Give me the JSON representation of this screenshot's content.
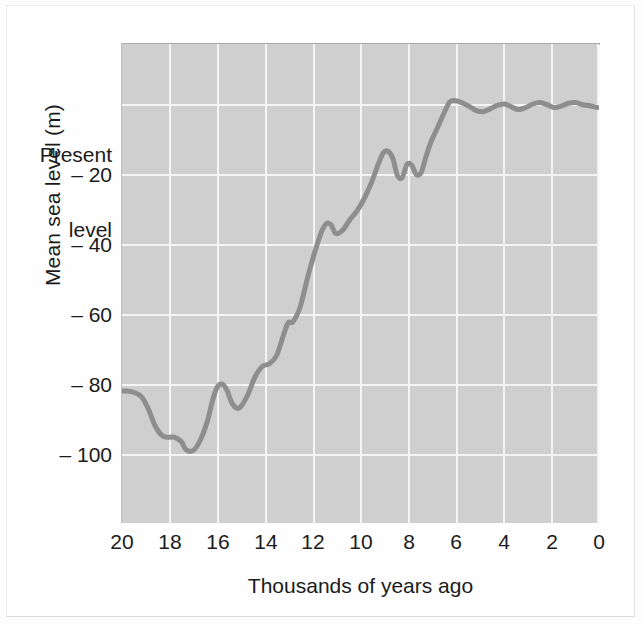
{
  "chart_data": {
    "type": "line",
    "title": "",
    "subtitle": "",
    "xlabel": "Thousands of years ago",
    "ylabel": "Mean sea level (m)",
    "xlim": [
      20,
      0
    ],
    "ylim": [
      -120,
      10
    ],
    "x_axis_direction": "decreasing-left-to-right",
    "grid": true,
    "legend": null,
    "annotations": [],
    "x_ticks": [
      "20",
      "18",
      "16",
      "14",
      "12",
      "10",
      "8",
      "6",
      "4",
      "2",
      "0"
    ],
    "x_tick_values": [
      20,
      18,
      16,
      14,
      12,
      10,
      8,
      6,
      4,
      2,
      0
    ],
    "y_ticks": [
      "Present level",
      "– 20",
      "– 40",
      "– 60",
      "– 80",
      "– 100"
    ],
    "y_tick_values": [
      0,
      -20,
      -40,
      -60,
      -80,
      -100
    ],
    "y_tick_present_line1": "Present",
    "y_tick_present_line2": "level",
    "series": [
      {
        "name": "Mean sea level",
        "units": "m",
        "x": [
          20.0,
          19.6,
          19.2,
          18.9,
          18.6,
          18.3,
          18.0,
          17.8,
          17.5,
          17.3,
          17.0,
          16.7,
          16.4,
          16.2,
          16.0,
          15.8,
          15.6,
          15.4,
          15.2,
          15.0,
          14.7,
          14.4,
          14.1,
          13.8,
          13.5,
          13.2,
          13.0,
          12.8,
          12.5,
          12.2,
          12.0,
          11.8,
          11.6,
          11.4,
          11.2,
          11.0,
          10.7,
          10.4,
          10.1,
          9.8,
          9.5,
          9.2,
          9.0,
          8.8,
          8.6,
          8.4,
          8.2,
          8.0,
          7.8,
          7.6,
          7.4,
          7.2,
          7.0,
          6.8,
          6.6,
          6.4,
          6.2,
          6.0,
          5.7,
          5.4,
          5.1,
          4.8,
          4.5,
          4.2,
          3.9,
          3.6,
          3.3,
          3.0,
          2.7,
          2.4,
          2.1,
          1.8,
          1.5,
          1.2,
          0.9,
          0.6,
          0.3,
          0.0
        ],
        "y": [
          -82.0,
          -82.2,
          -83.5,
          -87.0,
          -92.0,
          -94.8,
          -95.2,
          -95.2,
          -96.5,
          -98.8,
          -99.0,
          -96.0,
          -90.5,
          -85.0,
          -81.0,
          -80.0,
          -81.5,
          -85.0,
          -86.8,
          -86.5,
          -83.0,
          -78.0,
          -75.0,
          -74.2,
          -72.0,
          -66.0,
          -62.5,
          -62.2,
          -58.0,
          -50.0,
          -45.0,
          -40.5,
          -36.5,
          -34.2,
          -34.5,
          -37.0,
          -36.0,
          -33.0,
          -30.5,
          -27.0,
          -22.5,
          -17.0,
          -14.0,
          -13.5,
          -15.5,
          -20.5,
          -21.0,
          -17.2,
          -17.5,
          -20.2,
          -19.5,
          -15.0,
          -11.0,
          -8.0,
          -5.0,
          -2.0,
          0.6,
          1.0,
          0.4,
          -0.6,
          -1.8,
          -2.2,
          -1.4,
          -0.4,
          0.0,
          -0.8,
          -1.6,
          -1.0,
          0.0,
          0.4,
          -0.2,
          -1.0,
          -0.6,
          0.2,
          0.4,
          -0.2,
          -0.5,
          -1.0
        ],
        "color": "#8e8e8e",
        "line_width_px": 5
      }
    ],
    "key_features": {
      "lowest_level_m": -99.0,
      "lowest_level_age_ka": 17.0,
      "level_at_20ka_m": -82.0,
      "level_at_0ka_m": -1.0,
      "plot_background_color": "#cfcfcf",
      "gridline_color": "#f4f4f4",
      "curve_color": "#8e8e8e"
    }
  }
}
